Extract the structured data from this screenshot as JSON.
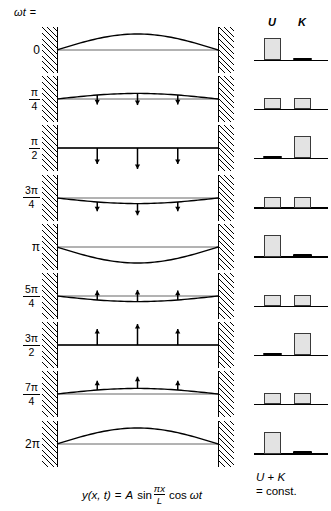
{
  "header": {
    "omega_t_label": "ωt ="
  },
  "energy_header": {
    "u_label": "U",
    "k_label": "K"
  },
  "energy_caption": {
    "line1_a": "U",
    "line1_plus": " + ",
    "line1_b": "K",
    "line2": "= const."
  },
  "equation": {
    "lhs": "y(x, t)",
    "eq": "=",
    "amp": "A",
    "sin": "sin",
    "num": "πx",
    "den": "L",
    "cos": "cos",
    "omega_t": "ωt"
  },
  "colors": {
    "ink": "#000000",
    "bar_fill": "#e3e3e3",
    "bar_stroke": "#3a3a3a",
    "baseline": "#000000"
  },
  "rows": [
    {
      "phase_plain": "0",
      "phase_num": "",
      "phase_den": "",
      "amplitude": 1.0,
      "arrows": "none",
      "arrow_len": 0,
      "u": 1.0,
      "k": 0.0
    },
    {
      "phase_plain": "",
      "phase_num": "π",
      "phase_den": "4",
      "amplitude": 0.35,
      "arrows": "down",
      "arrow_len": 0.45,
      "u": 0.5,
      "k": 0.5
    },
    {
      "phase_plain": "",
      "phase_num": "π",
      "phase_den": "2",
      "amplitude": 0.0,
      "arrows": "down",
      "arrow_len": 1.0,
      "u": 0.0,
      "k": 1.0
    },
    {
      "phase_plain": "",
      "phase_num": "3π",
      "phase_den": "4",
      "amplitude": -0.35,
      "arrows": "down",
      "arrow_len": 0.45,
      "u": 0.5,
      "k": 0.5
    },
    {
      "phase_plain": "π",
      "phase_num": "",
      "phase_den": "",
      "amplitude": -1.0,
      "arrows": "none",
      "arrow_len": 0,
      "u": 1.0,
      "k": 0.0
    },
    {
      "phase_plain": "",
      "phase_num": "5π",
      "phase_den": "4",
      "amplitude": -0.35,
      "arrows": "up",
      "arrow_len": 0.45,
      "u": 0.5,
      "k": 0.5
    },
    {
      "phase_plain": "",
      "phase_num": "3π",
      "phase_den": "2",
      "amplitude": 0.0,
      "arrows": "up",
      "arrow_len": 1.0,
      "u": 0.0,
      "k": 1.0
    },
    {
      "phase_plain": "",
      "phase_num": "7π",
      "phase_den": "4",
      "amplitude": 0.35,
      "arrows": "up",
      "arrow_len": 0.45,
      "u": 0.5,
      "k": 0.5
    },
    {
      "phase_plain": "2π",
      "phase_num": "",
      "phase_den": "",
      "amplitude": 1.0,
      "arrows": "none",
      "arrow_len": 0,
      "u": 1.0,
      "k": 0.0
    }
  ],
  "chart_data": {
    "type": "line",
    "xlabel": "x",
    "ylabel": "y",
    "x": [
      0,
      0.125,
      0.25,
      0.375,
      0.5,
      0.625,
      0.75,
      0.875,
      1.0
    ],
    "series": [
      {
        "name": "ωt = 0",
        "phase": 0.0,
        "values": [
          0,
          0.383,
          0.707,
          0.924,
          1.0,
          0.924,
          0.707,
          0.383,
          0
        ]
      },
      {
        "name": "ωt = π/4",
        "phase": 0.785,
        "values": [
          0,
          0.271,
          0.5,
          0.653,
          0.707,
          0.653,
          0.5,
          0.271,
          0
        ]
      },
      {
        "name": "ωt = π/2",
        "phase": 1.571,
        "values": [
          0,
          0,
          0,
          0,
          0,
          0,
          0,
          0,
          0
        ]
      },
      {
        "name": "ωt = 3π/4",
        "phase": 2.356,
        "values": [
          0,
          -0.271,
          -0.5,
          -0.653,
          -0.707,
          -0.653,
          -0.5,
          -0.271,
          0
        ]
      },
      {
        "name": "ωt = π",
        "phase": 3.142,
        "values": [
          0,
          -0.383,
          -0.707,
          -0.924,
          -1.0,
          -0.924,
          -0.707,
          -0.383,
          0
        ]
      },
      {
        "name": "ωt = 5π/4",
        "phase": 3.927,
        "values": [
          0,
          -0.271,
          -0.5,
          -0.653,
          -0.707,
          -0.653,
          -0.5,
          -0.271,
          0
        ]
      },
      {
        "name": "ωt = 3π/2",
        "phase": 4.712,
        "values": [
          0,
          0,
          0,
          0,
          0,
          0,
          0,
          0,
          0
        ]
      },
      {
        "name": "ωt = 7π/4",
        "phase": 5.498,
        "values": [
          0,
          0.271,
          0.5,
          0.653,
          0.707,
          0.653,
          0.5,
          0.271,
          0
        ]
      },
      {
        "name": "ωt = 2π",
        "phase": 6.283,
        "values": [
          0,
          0.383,
          0.707,
          0.924,
          1.0,
          0.924,
          0.707,
          0.383,
          0
        ]
      }
    ],
    "energy_bars": {
      "categories": [
        "0",
        "π/4",
        "π/2",
        "3π/4",
        "π",
        "5π/4",
        "3π/2",
        "7π/4",
        "2π"
      ],
      "U": [
        1.0,
        0.5,
        0.0,
        0.5,
        1.0,
        0.5,
        0.0,
        0.5,
        1.0
      ],
      "K": [
        0.0,
        0.5,
        1.0,
        0.5,
        0.0,
        0.5,
        1.0,
        0.5,
        0.0
      ],
      "ylim": [
        0,
        1
      ]
    },
    "equation": "y(x, t) = A sin(πx/L) cos ωt",
    "note": "U + K = const."
  }
}
